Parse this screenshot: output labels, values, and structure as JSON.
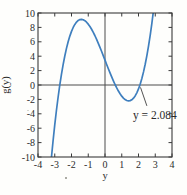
{
  "figure": {
    "background": "#fefefc",
    "frame_color": "#3a3a3a",
    "zero_line_color": "#4d4d4d",
    "text_color": "#2b2b2b"
  },
  "chart_data": {
    "type": "line",
    "title": "",
    "xlabel": "y",
    "ylabel": "g(y)",
    "xlim": [
      -4,
      4
    ],
    "ylim": [
      -10,
      10
    ],
    "x_ticks": [
      -4,
      -3,
      -2,
      -1,
      0,
      1,
      2,
      3,
      4
    ],
    "y_ticks": [
      -10,
      -8,
      -6,
      -4,
      -2,
      0,
      2,
      4,
      6,
      8,
      10
    ],
    "grid": false,
    "box": true,
    "zero_lines": true,
    "legend": null,
    "series": [
      {
        "name": "g(y)",
        "color": "#3f7fbe",
        "x": [
          -3.25,
          -3.2,
          -3.1,
          -3.0,
          -2.9,
          -2.8,
          -2.7,
          -2.6,
          -2.5,
          -2.4,
          -2.3,
          -2.2,
          -2.1,
          -2.0,
          -1.9,
          -1.8,
          -1.7,
          -1.6,
          -1.5,
          -1.4,
          -1.3,
          -1.2,
          -1.1,
          -1.0,
          -0.9,
          -0.8,
          -0.7,
          -0.6,
          -0.5,
          -0.4,
          -0.3,
          -0.2,
          -0.1,
          0,
          0.1,
          0.2,
          0.3,
          0.4,
          0.5,
          0.6,
          0.7,
          0.8,
          0.9,
          1.0,
          1.1,
          1.2,
          1.3,
          1.4,
          1.5,
          1.6,
          1.7,
          1.8,
          1.9,
          2.0,
          2.084,
          2.1,
          2.2,
          2.3,
          2.4,
          2.5,
          2.6,
          2.7,
          2.8,
          2.9
        ],
        "y": [
          -11.37,
          -10.11,
          -7.74,
          -5.55,
          -3.54,
          -1.7,
          -0.03,
          1.48,
          2.83,
          4.03,
          5.09,
          6.01,
          6.79,
          7.45,
          7.99,
          8.42,
          8.74,
          8.96,
          9.08,
          9.11,
          9.06,
          8.93,
          8.72,
          8.45,
          8.12,
          7.74,
          7.31,
          6.84,
          6.33,
          5.79,
          5.23,
          4.65,
          4.05,
          3.45,
          2.85,
          2.26,
          1.68,
          1.12,
          0.58,
          0.07,
          -0.4,
          -0.84,
          -1.22,
          -1.55,
          -1.82,
          -2.02,
          -2.15,
          -2.2,
          -2.17,
          -2.05,
          -1.83,
          -1.52,
          -1.09,
          -0.55,
          0.0,
          0.11,
          0.9,
          1.82,
          2.88,
          4.08,
          5.43,
          6.94,
          8.61,
          10.44
        ]
      }
    ],
    "annotations": [
      {
        "text": "y = 2.084",
        "label_x": 1.67,
        "label_y": -4.72,
        "leader": {
          "x1": 2.5,
          "y1": -2.9,
          "x2": 2.12,
          "y2": -0.33
        }
      }
    ]
  }
}
